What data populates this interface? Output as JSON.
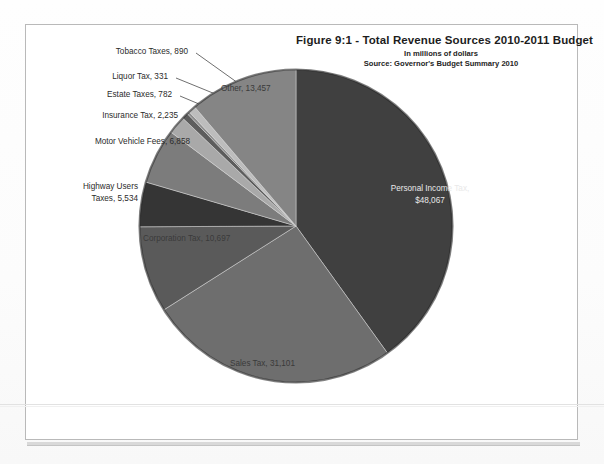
{
  "header": {
    "title": "Figure 9:1   - Total Revenue Sources  2010-2011 Budget",
    "subtitle": "In millions of dollars",
    "source": "Source:  Governor's Budget Summary 2010"
  },
  "labels": {
    "tobacco": "Tobacco Taxes, 890",
    "liquor": "Liquor Tax, 331",
    "estate": "Estate Taxes, 782",
    "insurance": "Insurance Tax, 2,235",
    "motor_vehicle": "Motor Vehicle Fees, 6,858",
    "highway_line1": "Highway Users",
    "highway_line2": "Taxes, 5,534",
    "corporation": "Corporation Tax, 10,697",
    "sales": "Sales Tax, 31,101",
    "other": "Other, 13,457",
    "personal_line1": "Personal Income Tax,",
    "personal_line2": "$48,067"
  },
  "chart_data": {
    "type": "pie",
    "title": "Figure 9:1   - Total Revenue Sources  2010-2011 Budget",
    "subtitle": "In millions of dollars",
    "source": "Source:  Governor's Budget Summary 2010",
    "units": "millions of dollars",
    "total": 119952,
    "start_angle_deg": 0,
    "direction": "clockwise",
    "legend": "none-labels-on-slices",
    "categories": [
      "Personal Income Tax",
      "Sales Tax",
      "Corporation Tax",
      "Highway Users Taxes",
      "Motor Vehicle Fees",
      "Insurance Tax",
      "Estate Taxes",
      "Liquor Tax",
      "Tobacco Taxes",
      "Other"
    ],
    "values": [
      48067,
      31101,
      10697,
      5534,
      6858,
      2235,
      782,
      331,
      890,
      13457
    ],
    "slices": [
      {
        "label": "Personal Income Tax",
        "value": 48067,
        "display": "Personal Income Tax, $48,067",
        "color": "#3f3f3f"
      },
      {
        "label": "Sales Tax",
        "value": 31101,
        "display": "Sales Tax, 31,101",
        "color": "#6e6e6e"
      },
      {
        "label": "Corporation Tax",
        "value": 10697,
        "display": "Corporation Tax, 10,697",
        "color": "#5a5a5a"
      },
      {
        "label": "Highway Users Taxes",
        "value": 5534,
        "display": "Highway Users Taxes, 5,534",
        "color": "#363636"
      },
      {
        "label": "Motor Vehicle Fees",
        "value": 6858,
        "display": "Motor Vehicle Fees, 6,858",
        "color": "#7c7c7c"
      },
      {
        "label": "Insurance Tax",
        "value": 2235,
        "display": "Insurance Tax, 2,235",
        "color": "#a9a9a9"
      },
      {
        "label": "Estate Taxes",
        "value": 782,
        "display": "Estate Taxes, 782",
        "color": "#5d5d5d"
      },
      {
        "label": "Liquor Tax",
        "value": 331,
        "display": "Liquor Tax, 331",
        "color": "#8d8d8d"
      },
      {
        "label": "Tobacco Taxes",
        "value": 890,
        "display": "Tobacco Taxes, 890",
        "color": "#bdbdbd"
      },
      {
        "label": "Other",
        "value": 13457,
        "display": "Other, 13,457",
        "color": "#858585"
      }
    ]
  },
  "colors": {
    "page_background": "#ffffff",
    "frame_border": "#b9b9b9",
    "text": "#2b2b2b",
    "title_text": "#1d1d1d"
  }
}
